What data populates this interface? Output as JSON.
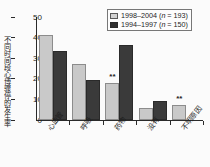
{
  "chart_data": {
    "type": "bar",
    "title": "",
    "xlabel": "",
    "ylabel": "不同时间段心博骤停的发生率",
    "ylim": [
      0,
      50
    ],
    "yticks": [
      0,
      10,
      20,
      30,
      40,
      50
    ],
    "grid": false,
    "legend_position": "top-right",
    "categories": [
      "心血管",
      "呼吸",
      "药物",
      "没有",
      "不明原因"
    ],
    "series": [
      {
        "name": "1998–2004 (n = 193)",
        "color": "#c9c9c9",
        "values": [
          41.5,
          27.0,
          18.0,
          6.0,
          7.5
        ]
      },
      {
        "name": "1994–1997 (n = 150)",
        "color": "#3a3a3a",
        "values": [
          33.5,
          19.3,
          36.5,
          9.0,
          null
        ]
      }
    ],
    "annotations": [
      {
        "category": "药物",
        "series": "1998–2004 (n = 193)",
        "text": "**"
      },
      {
        "category": "不明原因",
        "series": "1998–2004 (n = 193)",
        "text": "**"
      }
    ]
  },
  "legend": {
    "items": [
      {
        "label": "1998–2004 (",
        "italic": "n",
        "suffix": " = 193)",
        "swatch": "light"
      },
      {
        "label": "1994–1997 (",
        "italic": "n",
        "suffix": " = 150)",
        "swatch": "dark"
      }
    ]
  },
  "colors": {
    "series_light": "#c9c9c9",
    "series_dark": "#3a3a3a",
    "axis": "#2a2a2a",
    "text": "#1d1d1d",
    "background": "#fbfbfb"
  }
}
